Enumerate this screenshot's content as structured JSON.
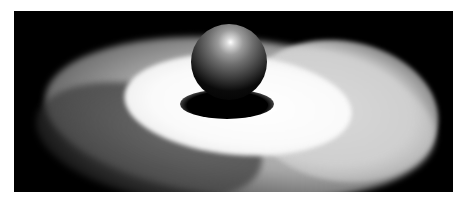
{
  "image": {
    "description": "3D render of a shaded sphere resting on a glowing elliptical disc with soft halo on a black background",
    "background_color": "#000000",
    "page_background": "#ffffff",
    "objects": [
      {
        "name": "sphere",
        "color": "#6e6e6e",
        "highlight": "#ffffff"
      },
      {
        "name": "inner-disc",
        "color": "#ffffff"
      },
      {
        "name": "outer-disc",
        "color": "#a8a8a8"
      },
      {
        "name": "contact-shadow",
        "color": "#000000"
      }
    ]
  }
}
